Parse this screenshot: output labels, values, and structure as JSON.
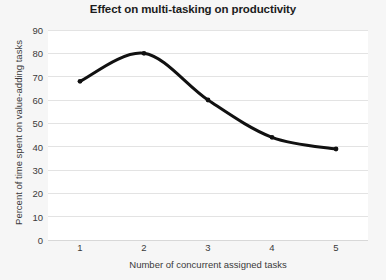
{
  "chart_data": {
    "type": "line",
    "title": "Effect on multi-tasking on productivity",
    "xlabel": "Number of concurrent assigned tasks",
    "ylabel": "Percent of time spent on value-adding tasks",
    "x": [
      1,
      2,
      3,
      4,
      5
    ],
    "values": [
      68,
      80,
      60,
      44,
      39
    ],
    "x_tick_labels": [
      "1",
      "2",
      "3",
      "4",
      "5"
    ],
    "y_tick_labels": [
      "0",
      "10",
      "20",
      "30",
      "40",
      "50",
      "60",
      "70",
      "80",
      "90"
    ],
    "y_ticks": [
      0,
      10,
      20,
      30,
      40,
      50,
      60,
      70,
      80,
      90
    ],
    "xlim": [
      0.5,
      5.5
    ],
    "ylim": [
      0,
      90
    ],
    "grid": "horizontal",
    "legend": "none",
    "series": [
      {
        "name": "Percent of time spent on value-adding tasks",
        "values": [
          68,
          80,
          60,
          44,
          39
        ],
        "color": "#111111",
        "line_width": 3,
        "marker": "dot",
        "smoothing": "spline"
      }
    ],
    "colors": {
      "line": "#111111",
      "grid": "#e3e3e3",
      "plot_background": "#ffffff",
      "figure_background": "#f6f6f6",
      "text": "#3a3a3a",
      "title_text": "#1c1c1c"
    }
  }
}
